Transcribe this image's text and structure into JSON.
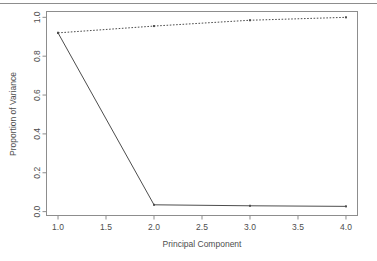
{
  "chart_data": {
    "type": "line",
    "title": "",
    "subtitle": "",
    "xlabel": "Principal Component",
    "ylabel": "Proportion of Variance",
    "xlim": [
      0.88,
      4.12
    ],
    "ylim": [
      -0.02,
      1.03
    ],
    "grid": false,
    "legend": null,
    "x": [
      1.0,
      2.0,
      3.0,
      4.0
    ],
    "xticks": [
      "1.0",
      "1.5",
      "2.0",
      "2.5",
      "3.0",
      "3.5",
      "4.0"
    ],
    "xtick_values": [
      1.0,
      1.5,
      2.0,
      2.5,
      3.0,
      3.5,
      4.0
    ],
    "yticks": [
      "0.0",
      "0.2",
      "0.4",
      "0.6",
      "0.8",
      "1.0"
    ],
    "ytick_values": [
      0.0,
      0.2,
      0.4,
      0.6,
      0.8,
      1.0
    ],
    "series": [
      {
        "name": "Proportion of Variance Explained",
        "style": "solid",
        "color": "#4d4d4d",
        "values": [
          0.92,
          0.035,
          0.03,
          0.027
        ]
      },
      {
        "name": "Cumulative Proportion of Variance Explained",
        "style": "dotted",
        "color": "#4d4d4d",
        "values": [
          0.92,
          0.955,
          0.985,
          1.0
        ]
      }
    ]
  },
  "axes": {
    "x_title": "Principal Component",
    "y_title": "Proportion of Variance"
  }
}
